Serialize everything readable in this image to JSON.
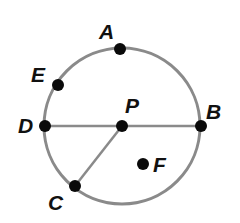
{
  "diagram": {
    "type": "circle-geometry",
    "colors": {
      "circle_stroke": "#8a8a8a",
      "segment_stroke": "#8a8a8a",
      "point_fill": "#0a0a0a",
      "label_fill": "#111111",
      "background": "#ffffff"
    },
    "circle": {
      "center": "P",
      "cx": 122,
      "cy": 126,
      "r": 78
    },
    "points": [
      {
        "name": "A",
        "label": "A",
        "x": 120,
        "y": 49,
        "label_x": 99,
        "label_y": 39,
        "location": "on circle"
      },
      {
        "name": "E",
        "label": "E",
        "x": 58,
        "y": 85,
        "label_x": 31,
        "label_y": 82,
        "location": "on circle"
      },
      {
        "name": "D",
        "label": "D",
        "x": 45,
        "y": 126,
        "label_x": 18,
        "label_y": 133,
        "location": "on circle"
      },
      {
        "name": "P",
        "label": "P",
        "x": 122,
        "y": 126,
        "label_x": 125,
        "label_y": 113,
        "location": "center"
      },
      {
        "name": "B",
        "label": "B",
        "x": 201,
        "y": 126,
        "label_x": 206,
        "label_y": 119,
        "location": "on circle"
      },
      {
        "name": "C",
        "label": "C",
        "x": 75,
        "y": 186,
        "label_x": 48,
        "label_y": 210,
        "location": "on circle"
      },
      {
        "name": "F",
        "label": "F",
        "x": 143,
        "y": 164,
        "label_x": 153,
        "label_y": 172,
        "location": "interior"
      }
    ],
    "segments": [
      {
        "name": "DB",
        "from": "D",
        "to": "B",
        "kind": "diameter"
      },
      {
        "name": "PC",
        "from": "P",
        "to": "C",
        "kind": "radius"
      }
    ]
  }
}
